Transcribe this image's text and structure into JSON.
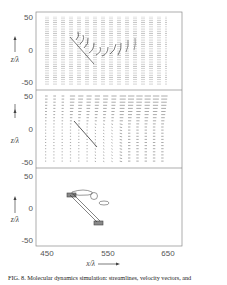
{
  "figure": {
    "caption": "FIG. 8. Molecular dynamics simulation: streamlines, velocity vectors, and",
    "x_axis_label": "x/λ",
    "x_ticks": [
      "450",
      "550",
      "650"
    ],
    "panels": [
      {
        "id": "streamlines",
        "y_axis_label": "z/λ",
        "y_ticks": [
          "50",
          "0",
          "-50"
        ]
      },
      {
        "id": "velocity-vectors",
        "y_axis_label": "z/λ",
        "y_ticks": [
          "50",
          "0",
          "-50"
        ]
      },
      {
        "id": "trajectory",
        "y_axis_label": "z/λ",
        "y_ticks": [
          "50",
          "0",
          "-50"
        ]
      }
    ]
  },
  "chart_data": [
    {
      "type": "scatter",
      "title": "Streamlines",
      "xlabel": "x/λ",
      "ylabel": "z/λ",
      "xlim": [
        435,
        665
      ],
      "ylim": [
        -60,
        60
      ],
      "x_ticks": [
        450,
        550,
        650
      ],
      "y_ticks": [
        50,
        0,
        -50
      ],
      "annotations": [
        "diagonal line from (500,20) to (535,-20)",
        "vertical streamline columns x≈455–625 over z≈-52..52, deflected near the line"
      ]
    },
    {
      "type": "scatter",
      "title": "Velocity vectors",
      "xlabel": "x/λ",
      "ylabel": "z/λ",
      "xlim": [
        435,
        665
      ],
      "ylim": [
        -60,
        60
      ],
      "x_ticks": [
        450,
        550,
        650
      ],
      "y_ticks": [
        50,
        0,
        -50
      ],
      "annotations": [
        "grid of velocity arrows, mostly pointing right, larger near top",
        "diagonal line from (500,20) to (535,-20)"
      ]
    },
    {
      "type": "line",
      "title": "Trajectory",
      "xlabel": "x/λ",
      "ylabel": "z/λ",
      "xlim": [
        435,
        665
      ],
      "ylim": [
        -60,
        60
      ],
      "x_ticks": [
        450,
        550,
        650
      ],
      "y_ticks": [
        50,
        0,
        -50
      ],
      "annotations": [
        "dense cluster near (493,22)",
        "dense cluster near (538,-22)",
        "two parallel lines connecting clusters",
        "small closed loops near (520,22), (545,18), (570,8)"
      ]
    }
  ]
}
